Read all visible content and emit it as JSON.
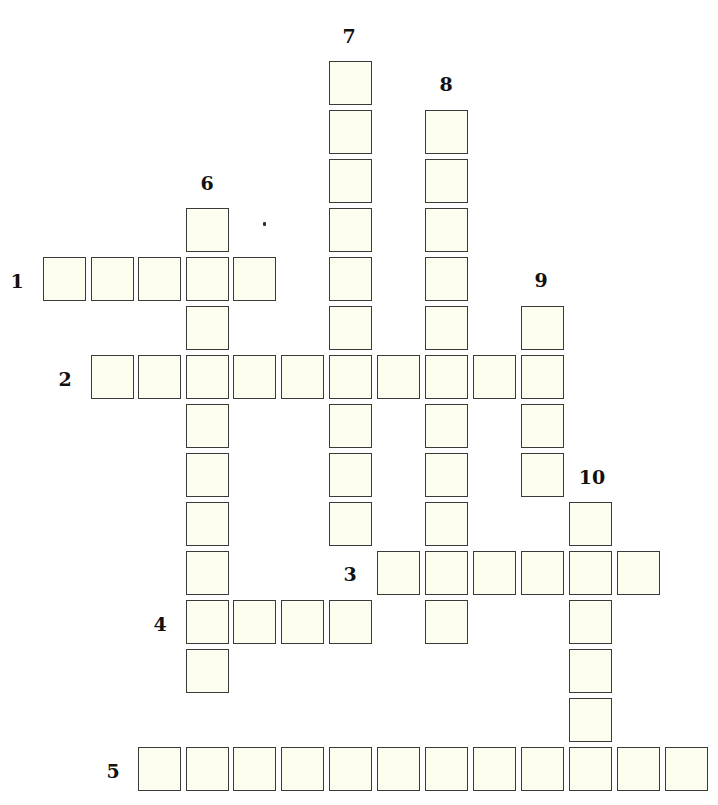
{
  "puzzle": {
    "grid": {
      "col_x": [
        43,
        91,
        138,
        186,
        233,
        281,
        329,
        377,
        425,
        473,
        521,
        569,
        617,
        665
      ],
      "row_y": [
        61,
        110,
        159,
        208,
        257,
        306,
        355,
        404,
        453,
        502,
        551,
        600,
        649,
        698,
        747
      ],
      "cell_fill": "#fdfdf0",
      "cell_border": "#3a3a3a"
    },
    "across": [
      {
        "number": "1",
        "row": 4,
        "col": 0,
        "length": 5,
        "label_x": 17,
        "label_y": 281
      },
      {
        "number": "2",
        "row": 6,
        "col": 1,
        "length": 10,
        "label_x": 65,
        "label_y": 379
      },
      {
        "number": "3",
        "row": 10,
        "col": 7,
        "length": 6,
        "label_x": 350,
        "label_y": 574
      },
      {
        "number": "4",
        "row": 11,
        "col": 3,
        "length": 4,
        "label_x": 160,
        "label_y": 624
      },
      {
        "number": "5",
        "row": 14,
        "col": 2,
        "length": 12,
        "label_x": 113,
        "label_y": 771
      }
    ],
    "down": [
      {
        "number": "6",
        "row": 3,
        "col": 3,
        "length": 10,
        "label_x": 207,
        "label_y": 183
      },
      {
        "number": "7",
        "row": 0,
        "col": 6,
        "length": 10,
        "label_x": 349,
        "label_y": 36
      },
      {
        "number": "8",
        "row": 1,
        "col": 8,
        "length": 11,
        "label_x": 446,
        "label_y": 84
      },
      {
        "number": "9",
        "row": 5,
        "col": 10,
        "length": 4,
        "label_x": 541,
        "label_y": 280
      },
      {
        "number": "10",
        "row": 9,
        "col": 11,
        "length": 6,
        "label_x": 592,
        "label_y": 477
      }
    ]
  }
}
